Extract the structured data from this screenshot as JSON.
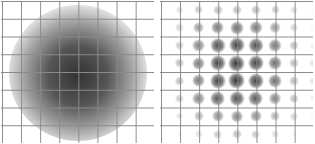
{
  "panels": [
    {
      "id": "left",
      "description": "dense diffuse gray cloud centered on grid",
      "grid": {
        "columns": 8,
        "rows": 8
      },
      "cloud_color": "#333333"
    },
    {
      "id": "right",
      "description": "lattice of dark gaussian blobs at grid intersections, intensity peaking at center",
      "grid": {
        "columns": 8,
        "rows": 8
      },
      "blob_color": "#2a2a2a",
      "blob_intensity": [
        [
          0.15,
          0.25,
          0.3,
          0.3,
          0.3,
          0.25,
          0.15,
          0.05
        ],
        [
          0.2,
          0.45,
          0.6,
          0.65,
          0.6,
          0.45,
          0.2,
          0.05
        ],
        [
          0.25,
          0.55,
          0.8,
          0.85,
          0.8,
          0.6,
          0.3,
          0.1
        ],
        [
          0.3,
          0.6,
          0.85,
          0.9,
          0.85,
          0.65,
          0.3,
          0.15
        ],
        [
          0.3,
          0.6,
          0.85,
          0.9,
          0.85,
          0.65,
          0.3,
          0.15
        ],
        [
          0.25,
          0.55,
          0.75,
          0.8,
          0.75,
          0.55,
          0.3,
          0.1
        ],
        [
          0.15,
          0.35,
          0.5,
          0.55,
          0.5,
          0.35,
          0.2,
          0.05
        ],
        [
          0.05,
          0.15,
          0.25,
          0.3,
          0.25,
          0.15,
          0.05,
          0.02
        ]
      ]
    }
  ]
}
